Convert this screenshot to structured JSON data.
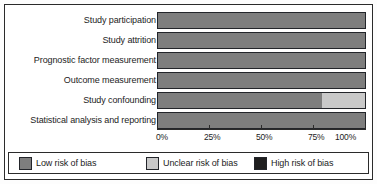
{
  "chart_data": {
    "type": "bar",
    "orientation": "horizontal",
    "stacked": true,
    "title": "",
    "xlabel": "",
    "ylabel": "",
    "xlim": [
      0,
      100
    ],
    "grid": false,
    "legend_position": "bottom",
    "categories": [
      "Study participation",
      "Study attrition",
      "Prognostic factor measurement",
      "Outcome measurement",
      "Study confounding",
      "Statistical analysis and reporting"
    ],
    "series": [
      {
        "name": "Low risk of bias",
        "color": "#7e7e7e",
        "values": [
          100,
          100,
          100,
          100,
          79,
          100
        ]
      },
      {
        "name": "Unclear risk of bias",
        "color": "#c9c9c9",
        "values": [
          0,
          0,
          0,
          0,
          21,
          0
        ]
      },
      {
        "name": "High risk of bias",
        "color": "#1f1f1f",
        "values": [
          0,
          0,
          0,
          0,
          0,
          0
        ]
      }
    ],
    "tick_labels": [
      "0%",
      "25%",
      "50%",
      "75%",
      "100%"
    ],
    "tick_values": [
      0,
      25,
      50,
      75,
      100
    ]
  },
  "axis": {
    "ticks": [
      {
        "label": "0%",
        "value": 0
      },
      {
        "label": "25%",
        "value": 25
      },
      {
        "label": "50%",
        "value": 50
      },
      {
        "label": "75%",
        "value": 75
      },
      {
        "label": "100%",
        "value": 100
      }
    ]
  },
  "rows": [
    {
      "label": "Study participation",
      "low": 100,
      "unclear": 0,
      "high": 0
    },
    {
      "label": "Study attrition",
      "low": 100,
      "unclear": 0,
      "high": 0
    },
    {
      "label": "Prognostic factor measurement",
      "low": 100,
      "unclear": 0,
      "high": 0
    },
    {
      "label": "Outcome measurement",
      "low": 100,
      "unclear": 0,
      "high": 0
    },
    {
      "label": "Study confounding",
      "low": 79,
      "unclear": 21,
      "high": 0
    },
    {
      "label": "Statistical analysis and reporting",
      "low": 100,
      "unclear": 0,
      "high": 0
    }
  ],
  "legend": {
    "items": [
      {
        "label": "Low risk of bias",
        "color": "#7e7e7e",
        "key": "low"
      },
      {
        "label": "Unclear risk of bias",
        "color": "#c9c9c9",
        "key": "unclear"
      },
      {
        "label": "High risk of bias",
        "color": "#1f1f1f",
        "key": "high"
      }
    ]
  }
}
